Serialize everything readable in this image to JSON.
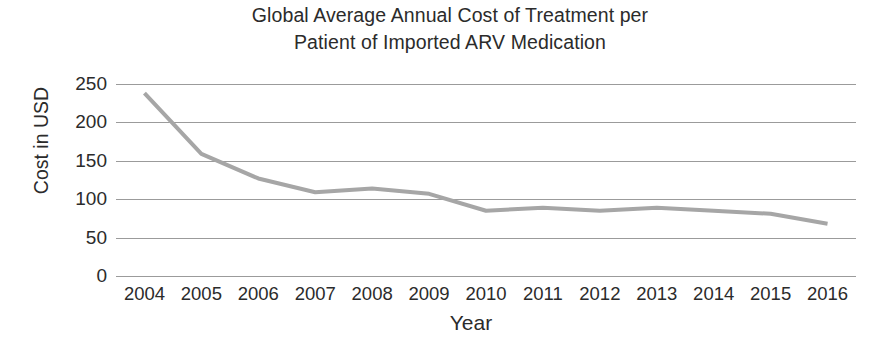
{
  "chart_data": {
    "type": "line",
    "title": "Global Average Annual Cost of Treatment per Patient of Imported ARV Medication",
    "title_line1": "Global Average Annual Cost of Treatment per",
    "title_line2": "Patient of Imported ARV Medication",
    "xlabel": "Year",
    "ylabel": "Cost in USD",
    "categories": [
      "2004",
      "2005",
      "2006",
      "2007",
      "2008",
      "2009",
      "2010",
      "2011",
      "2012",
      "2013",
      "2014",
      "2015",
      "2016"
    ],
    "values": [
      238,
      159,
      127,
      109,
      114,
      107,
      85,
      89,
      85,
      89,
      85,
      81,
      68
    ],
    "series": [
      {
        "name": "Cost in USD",
        "values": [
          238,
          159,
          127,
          109,
          114,
          107,
          85,
          89,
          85,
          89,
          85,
          81,
          68
        ]
      }
    ],
    "ylim": [
      0,
      250
    ],
    "y_ticks": [
      "0",
      "50",
      "100",
      "150",
      "200",
      "250"
    ],
    "y_tick_values": [
      0,
      50,
      100,
      150,
      200,
      250
    ],
    "grid": "horizontal",
    "legend": "none",
    "line_color": "#a6a6a6",
    "grid_color": "#9b9b9b",
    "text_color": "#2b2b2b",
    "background_color": "#ffffff"
  }
}
